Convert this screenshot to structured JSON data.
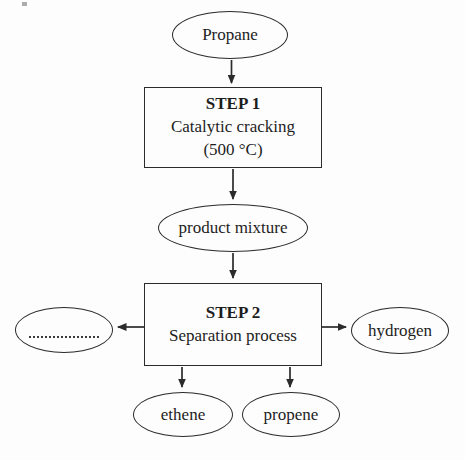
{
  "flowchart": {
    "nodes": {
      "propane": {
        "shape": "ellipse",
        "label": "Propane"
      },
      "step1": {
        "shape": "rect",
        "heading": "STEP 1",
        "line1": "Catalytic cracking",
        "line2": "(500 °C)"
      },
      "product_mixture": {
        "shape": "ellipse",
        "label": "product mixture"
      },
      "step2": {
        "shape": "rect",
        "heading": "STEP 2",
        "line1": "Separation process"
      },
      "unknown_blank": {
        "shape": "ellipse",
        "label": "",
        "note": "empty answer blank with dotted line"
      },
      "hydrogen": {
        "shape": "ellipse",
        "label": "hydrogen"
      },
      "ethene": {
        "shape": "ellipse",
        "label": "ethene"
      },
      "propene": {
        "shape": "ellipse",
        "label": "propene"
      }
    },
    "edges": [
      {
        "from": "propane",
        "to": "step1"
      },
      {
        "from": "step1",
        "to": "product_mixture"
      },
      {
        "from": "product_mixture",
        "to": "step2"
      },
      {
        "from": "step2",
        "to": "unknown_blank"
      },
      {
        "from": "step2",
        "to": "hydrogen"
      },
      {
        "from": "step2",
        "to": "ethene"
      },
      {
        "from": "step2",
        "to": "propene"
      }
    ],
    "colors": {
      "stroke": "#2b2b2b",
      "text": "#1d1d1d",
      "background": "#fdfdfd"
    }
  }
}
